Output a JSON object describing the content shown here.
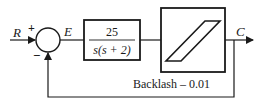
{
  "diagram": {
    "type": "feedback-control-block-diagram",
    "colors": {
      "stroke": "#1a1a1a",
      "background": "#ffffff"
    },
    "signals": {
      "input": "R",
      "error": "E",
      "output": "C"
    },
    "summing_junction": {
      "plus_sign": "+",
      "minus_sign": "−"
    },
    "plant": {
      "numerator": "25",
      "denominator": "s(s + 2)"
    },
    "nonlinearity": {
      "name": "backlash",
      "label": "Backlash – 0.01"
    }
  }
}
